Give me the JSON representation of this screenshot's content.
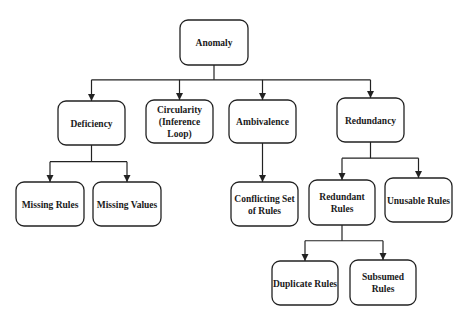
{
  "diagram": {
    "type": "tree",
    "nodes": [
      {
        "id": "anomaly",
        "lines": [
          "Anomaly"
        ]
      },
      {
        "id": "deficiency",
        "lines": [
          "Deficiency"
        ]
      },
      {
        "id": "circularity",
        "lines": [
          "Circularity",
          "(Inference",
          "Loop)"
        ]
      },
      {
        "id": "ambivalence",
        "lines": [
          "Ambivalence"
        ]
      },
      {
        "id": "redundancy",
        "lines": [
          "Redundancy"
        ]
      },
      {
        "id": "missing-rules",
        "lines": [
          "Missing Rules"
        ]
      },
      {
        "id": "missing-values",
        "lines": [
          "Missing Values"
        ]
      },
      {
        "id": "conflicting-set-of-rules",
        "lines": [
          "Conflicting Set",
          "of Rules"
        ]
      },
      {
        "id": "redundant-rules",
        "lines": [
          "Redundant",
          "Rules"
        ]
      },
      {
        "id": "unusable-rules",
        "lines": [
          "Unusable Rules"
        ]
      },
      {
        "id": "duplicate-rules",
        "lines": [
          "Duplicate Rules"
        ]
      },
      {
        "id": "subsumed-rules",
        "lines": [
          "Subsumed",
          "Rules"
        ]
      }
    ],
    "edges": [
      {
        "from": "anomaly",
        "to": [
          "deficiency",
          "circularity",
          "ambivalence",
          "redundancy"
        ]
      },
      {
        "from": "deficiency",
        "to": [
          "missing-rules",
          "missing-values"
        ]
      },
      {
        "from": "ambivalence",
        "to": [
          "conflicting-set-of-rules"
        ]
      },
      {
        "from": "redundancy",
        "to": [
          "redundant-rules",
          "unusable-rules"
        ]
      },
      {
        "from": "redundant-rules",
        "to": [
          "duplicate-rules",
          "subsumed-rules"
        ]
      }
    ]
  }
}
